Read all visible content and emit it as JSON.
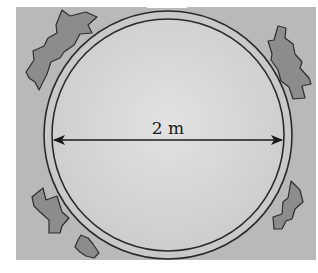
{
  "figure": {
    "dimension_label": "2 m",
    "colors": {
      "ground": "#b9b9b9",
      "pool_fill": "#d6d6d6",
      "ring_fill": "#c9c9c9",
      "outline": "#2a2a2a",
      "rock_fill": "#8c8c8c",
      "arrow": "#1a1a1a"
    }
  }
}
